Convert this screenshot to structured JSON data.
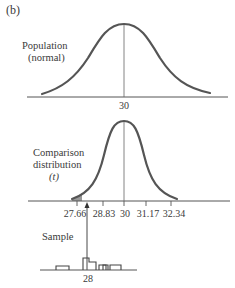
{
  "figure_label": "(b)",
  "population": {
    "label_line1": "Population",
    "label_line2": "(normal)",
    "mean_label": "30"
  },
  "comparison": {
    "label_line1": "Comparison",
    "label_line2": "distribution",
    "label_line3": "(t)",
    "ticks": [
      "27.66",
      "28.83",
      "30",
      "31.17",
      "32.34"
    ]
  },
  "sample": {
    "label": "Sample",
    "mean_label": "28"
  },
  "colors": {
    "curve": "#555555",
    "axis": "#555555",
    "shade": "#999999"
  }
}
